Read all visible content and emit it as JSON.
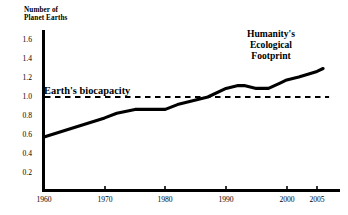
{
  "chart_data": {
    "type": "line",
    "title": "",
    "xlabel": "",
    "ylabel": "Number of\nPlanet Earths",
    "xlim": [
      1960,
      2007
    ],
    "ylim": [
      0,
      1.72
    ],
    "grid": false,
    "legend_position": "inline-annotation",
    "xticks": [
      1960,
      1970,
      1980,
      1990,
      2000,
      2005
    ],
    "xtick_labels": [
      "1960",
      "1970",
      "1980",
      "1990",
      "2000",
      "2005"
    ],
    "yticks": [
      0.2,
      0.4,
      0.6,
      0.8,
      1.0,
      1.2,
      1.4,
      1.6
    ],
    "ytick_labels": [
      "0.2",
      "0.4",
      "0.6",
      "0.8",
      "1.0",
      "1.2",
      "1.4",
      "1.6"
    ],
    "series": [
      {
        "name": "Humanity's Ecological Footprint",
        "style": "solid",
        "label_text": "Humanity's\nEcological\nFootprint",
        "x": [
          1960,
          1965,
          1970,
          1972,
          1975,
          1977,
          1980,
          1982,
          1985,
          1987,
          1990,
          1992,
          1993,
          1995,
          1997,
          1999,
          2000,
          2002,
          2005,
          2006
        ],
        "values": [
          0.58,
          0.68,
          0.78,
          0.83,
          0.87,
          0.87,
          0.87,
          0.92,
          0.97,
          1.0,
          1.09,
          1.12,
          1.12,
          1.09,
          1.09,
          1.15,
          1.18,
          1.21,
          1.27,
          1.3
        ]
      },
      {
        "name": "Earth's biocapacity",
        "style": "dashed",
        "label_text": "Earth's biocapacity",
        "x": [
          1960,
          2007
        ],
        "values": [
          1.0,
          1.0
        ]
      }
    ],
    "annotations": [
      {
        "text": "Earth's biocapacity",
        "x": 1960,
        "y": 1.0
      },
      {
        "text": "Humanity's Ecological Footprint",
        "x": 1997,
        "y": 1.55
      }
    ],
    "colors": {
      "line": "#000000",
      "axis": "#000000",
      "background": "#ffffff",
      "text": "#000000"
    }
  }
}
